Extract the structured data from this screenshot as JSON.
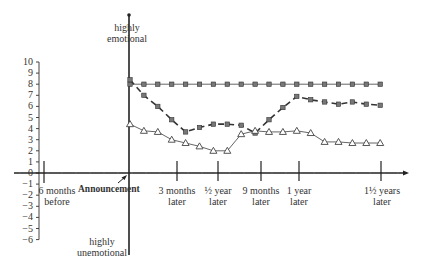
{
  "chart_data": {
    "type": "line",
    "title": "",
    "ylabel_top": "highly emotional",
    "ylabel_bottom": "highly unemotional",
    "xlabel": "",
    "ylim": [
      -6,
      10
    ],
    "yticks": [
      10,
      9,
      8,
      7,
      6,
      5,
      4,
      3,
      2,
      1,
      0,
      -1,
      -2,
      -3,
      -4,
      -5,
      -6
    ],
    "grid": false,
    "x_milestones": [
      {
        "label": "6 months before",
        "pos": -6
      },
      {
        "label": "Announcement",
        "pos": 0
      },
      {
        "label": "3 months later",
        "pos": 3
      },
      {
        "label": "½ year later",
        "pos": 6
      },
      {
        "label": "9 months later",
        "pos": 9
      },
      {
        "label": "1 year later",
        "pos": 12
      },
      {
        "label": "1½ years later",
        "pos": 18
      }
    ],
    "x": [
      0,
      1,
      2,
      3,
      4,
      5,
      6,
      7,
      8,
      9,
      10,
      11,
      12,
      13,
      14,
      15,
      16,
      17,
      18
    ],
    "series": [
      {
        "name": "flat (squares, solid)",
        "marker": "filled-square",
        "line": "solid",
        "values": [
          8.0,
          8.0,
          8.0,
          8.0,
          8.0,
          8.0,
          8.0,
          8.0,
          8.0,
          8.0,
          8.0,
          8.0,
          8.0,
          8.0,
          8.0,
          8.0,
          8.0,
          8.0,
          8.0
        ]
      },
      {
        "name": "dip (squares, dashed)",
        "marker": "filled-square",
        "line": "dashed",
        "values": [
          8.4,
          7.0,
          6.0,
          4.8,
          3.7,
          4.1,
          4.4,
          4.4,
          4.3,
          3.6,
          4.8,
          5.9,
          6.9,
          6.6,
          6.4,
          6.2,
          6.4,
          6.2,
          6.1
        ]
      },
      {
        "name": "low (triangles, solid)",
        "marker": "open-triangle",
        "line": "solid",
        "values": [
          4.4,
          3.8,
          3.7,
          3.0,
          2.7,
          2.4,
          2.0,
          2.0,
          3.5,
          3.8,
          3.7,
          3.7,
          3.8,
          3.6,
          2.8,
          2.8,
          2.7,
          2.7,
          2.7
        ]
      }
    ],
    "annotations": [
      {
        "text": "Announcement",
        "arrow_to": "origin"
      }
    ]
  },
  "labels": {
    "top": [
      "highly",
      "emotional"
    ],
    "bottom": [
      "highly",
      "unemotional"
    ],
    "announcement": "Announcement",
    "six_before": [
      "6 months",
      "before"
    ],
    "three_later": [
      "3 months",
      "later"
    ],
    "half_year": [
      "½ year",
      "later"
    ],
    "nine_later": [
      "9 months",
      "later"
    ],
    "one_year": [
      "1 year",
      "later"
    ],
    "one_half_years": [
      "1½ years",
      "later"
    ]
  }
}
